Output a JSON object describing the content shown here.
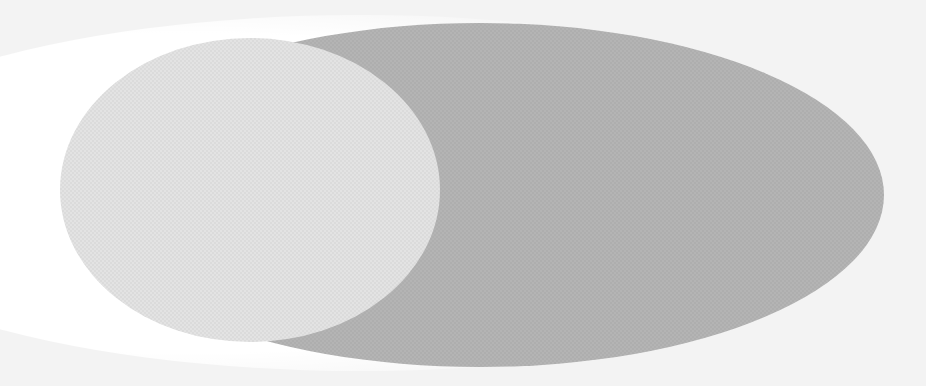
{
  "diagram": {
    "type": "overlapping-ellipses",
    "caption": "",
    "background": {
      "color": "#f3f3f3",
      "glow_color": "#ffffff"
    },
    "shapes": [
      {
        "id": "large-ellipse",
        "fill": "#b4b4b4",
        "cx": 480,
        "cy": 195,
        "rx": 404,
        "ry": 172
      },
      {
        "id": "small-ellipse",
        "fill": "#e3e3e3",
        "cx": 250,
        "cy": 190,
        "rx": 190,
        "ry": 152
      }
    ]
  }
}
